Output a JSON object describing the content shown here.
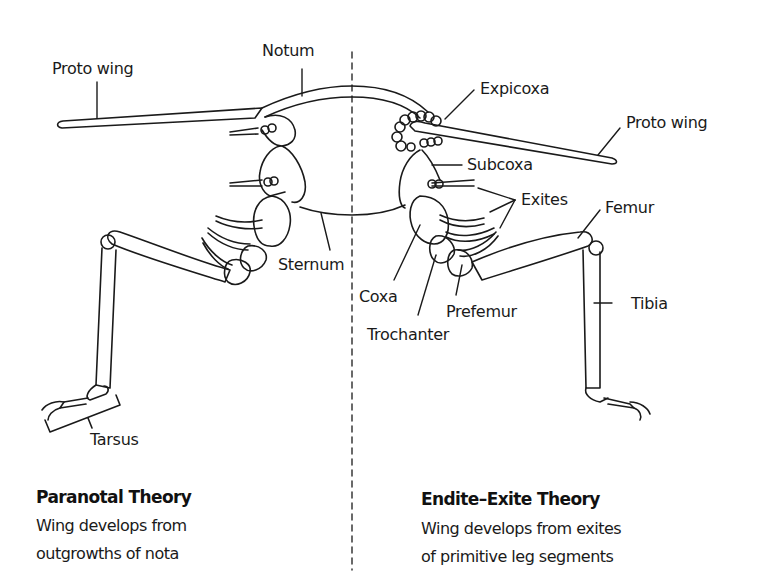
{
  "left_panel": {
    "labels": {
      "proto_wing": "Proto wing",
      "notum": "Notum",
      "sternum": "Sternum",
      "tarsus": "Tarsus"
    },
    "theory_title": "Paranotal Theory",
    "theory_description_line1": "Wing develops from",
    "theory_description_line2": "outgrowths of nota"
  },
  "right_panel": {
    "labels": {
      "expicoxa": "Expicoxa",
      "proto_wing": "Proto wing",
      "subcoxa": "Subcoxa",
      "exites": "Exites",
      "femur": "Femur",
      "coxa": "Coxa",
      "prefemur": "Prefemur",
      "trochanter": "Trochanter",
      "tibia": "Tibia"
    },
    "theory_title": "Endite–Exite Theory",
    "theory_description_line1": "Wing develops from exites",
    "theory_description_line2": "of primitive leg segments"
  },
  "colors": {
    "line": "#1a1a1a",
    "background": "#ffffff"
  }
}
